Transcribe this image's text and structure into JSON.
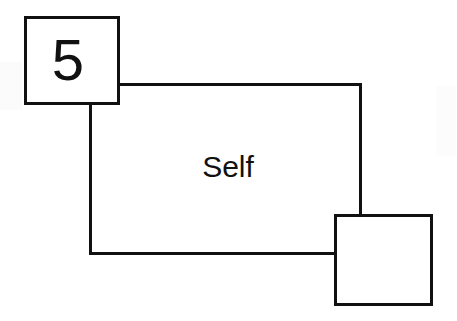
{
  "diagram": {
    "type": "state-transition-diagram",
    "background_color": "#ffffff",
    "stroke_color": "#111111",
    "stroke_width": 3,
    "nodes": [
      {
        "id": "state-5",
        "label": "5",
        "shape": "square",
        "x": 24,
        "y": 16,
        "width": 96,
        "height": 89,
        "label_x": 68,
        "label_y": 80,
        "filled": false
      },
      {
        "id": "state-blank",
        "label": "",
        "shape": "square",
        "x": 334,
        "y": 214,
        "width": 99,
        "height": 92,
        "filled": false
      }
    ],
    "edges": [
      {
        "id": "self-loop",
        "label": "Self",
        "label_x": 228,
        "label_y": 177,
        "from": "state-5",
        "to": "state-blank",
        "kind": "orthogonal-polyline",
        "segments": [
          {
            "from_x": 120,
            "from_y": 84,
            "to_x": 360,
            "to_y": 84
          },
          {
            "from_x": 360,
            "from_y": 84,
            "to_x": 360,
            "to_y": 216
          },
          {
            "from_x": 90,
            "from_y": 104,
            "to_x": 90,
            "to_y": 253
          },
          {
            "from_x": 90,
            "from_y": 253,
            "to_x": 336,
            "to_y": 253
          }
        ]
      }
    ]
  }
}
